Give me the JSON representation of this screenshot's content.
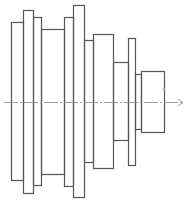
{
  "diagram": {
    "type": "stepped-shaft-profile",
    "stroke_color": "#555555",
    "centerline_color": "#888888",
    "background": "#ffffff",
    "centerline": {
      "y": 102,
      "x1": 4,
      "x2": 183,
      "style": "dash-dot",
      "arrow": "right"
    },
    "shaft_segments": [
      {
        "id": "seg-1",
        "x": 11,
        "y": 22,
        "w": 12,
        "h": 158
      },
      {
        "id": "seg-2",
        "x": 23,
        "y": 10,
        "w": 10,
        "h": 183
      },
      {
        "id": "seg-3",
        "x": 33,
        "y": 17,
        "w": 8,
        "h": 168
      },
      {
        "id": "seg-4",
        "x": 41,
        "y": 29,
        "w": 23,
        "h": 145
      },
      {
        "id": "seg-5",
        "x": 64,
        "y": 17,
        "w": 9,
        "h": 169
      },
      {
        "id": "seg-6",
        "x": 73,
        "y": 5,
        "w": 11,
        "h": 192
      },
      {
        "id": "seg-7",
        "x": 84,
        "y": 40,
        "w": 9,
        "h": 122
      },
      {
        "id": "seg-8",
        "x": 93,
        "y": 34,
        "w": 20,
        "h": 134
      },
      {
        "id": "seg-9",
        "x": 113,
        "y": 62,
        "w": 15,
        "h": 78
      },
      {
        "id": "seg-10",
        "x": 128,
        "y": 38,
        "w": 7,
        "h": 127
      },
      {
        "id": "seg-11",
        "x": 135,
        "y": 74,
        "w": 6,
        "h": 55
      },
      {
        "id": "seg-12",
        "x": 141,
        "y": 71,
        "w": 23,
        "h": 61
      }
    ],
    "small_mark": {
      "x": 164,
      "y": 88,
      "label": ""
    }
  }
}
